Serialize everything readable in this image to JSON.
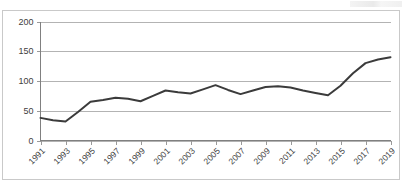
{
  "chart_data": {
    "type": "line",
    "title": "",
    "subtitle": "",
    "xlabel": "",
    "ylabel": "",
    "ylim": [
      0,
      200
    ],
    "yticks": [
      0,
      50,
      100,
      150,
      200
    ],
    "ytick_labels": [
      "0",
      "50",
      "100",
      "150",
      "200"
    ],
    "grid": true,
    "legend": false,
    "legend_position": "none",
    "x_tick_rotation": 45,
    "series_color": "#3b3b3b",
    "gridline_color": "#b3b3b3",
    "x": [
      1991,
      1992,
      1993,
      1994,
      1995,
      1996,
      1997,
      1998,
      1999,
      2000,
      2001,
      2002,
      2003,
      2004,
      2005,
      2006,
      2007,
      2008,
      2009,
      2010,
      2011,
      2012,
      2013,
      2014,
      2015,
      2016,
      2017,
      2018,
      2019
    ],
    "xtick_labels": [
      "1991",
      "1993",
      "1995",
      "1997",
      "1999",
      "2001",
      "2003",
      "2005",
      "2007",
      "2009",
      "2011",
      "2013",
      "2015",
      "2017",
      "2019"
    ],
    "values": [
      38,
      34,
      32,
      48,
      65,
      68,
      72,
      70,
      66,
      75,
      84,
      81,
      79,
      86,
      93,
      85,
      78,
      84,
      90,
      91,
      89,
      84,
      80,
      76,
      92,
      113,
      130,
      136,
      140
    ],
    "series": [
      {
        "name": "Series 1",
        "color": "#3b3b3b",
        "values": [
          38,
          34,
          32,
          48,
          65,
          68,
          72,
          70,
          66,
          75,
          84,
          81,
          79,
          86,
          93,
          85,
          78,
          84,
          90,
          91,
          89,
          84,
          80,
          76,
          92,
          113,
          130,
          136,
          140
        ]
      }
    ]
  }
}
